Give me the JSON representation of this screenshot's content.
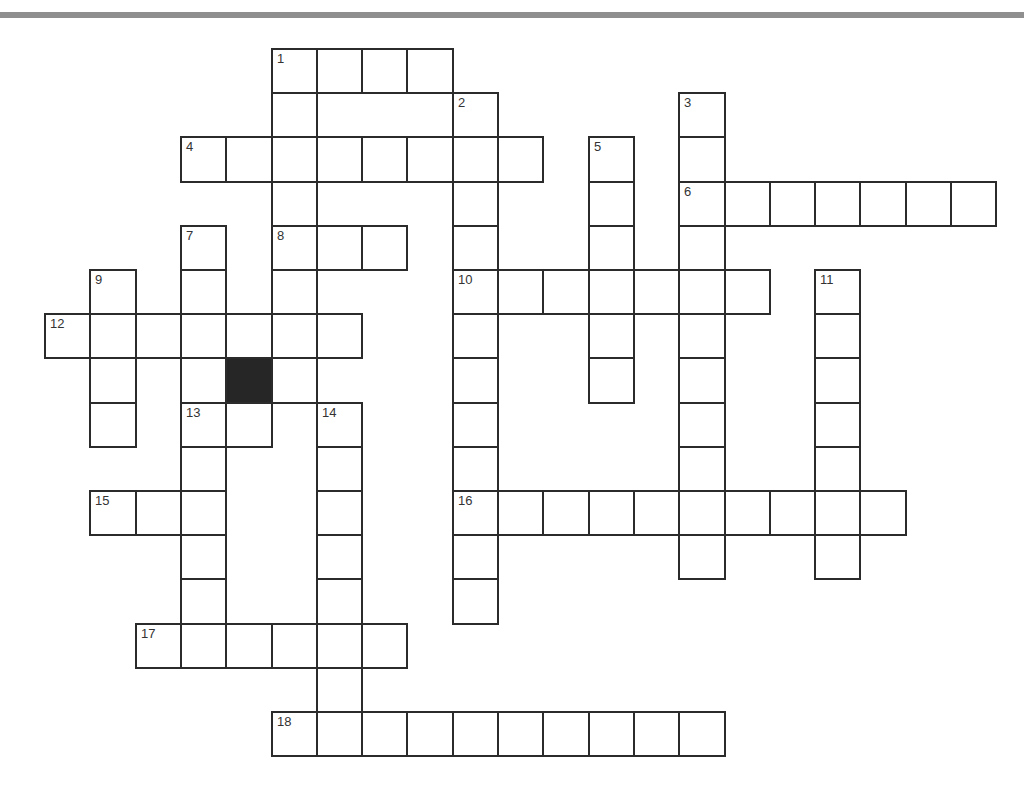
{
  "puzzle": {
    "type": "crossword",
    "grid": {
      "origin_x": 44,
      "origin_y": 48,
      "cell_w": 45.3,
      "cell_h": 44.2,
      "border_color": "#2b2b2b",
      "black_color": "#262626"
    },
    "entries": [
      {
        "number": "1",
        "direction": "across",
        "row": 0,
        "col": 5,
        "length": 4
      },
      {
        "number": "1",
        "direction": "down",
        "row": 0,
        "col": 5,
        "length": 8
      },
      {
        "number": "2",
        "direction": "down",
        "row": 1,
        "col": 9,
        "length": 12
      },
      {
        "number": "3",
        "direction": "down",
        "row": 1,
        "col": 14,
        "length": 11
      },
      {
        "number": "4",
        "direction": "across",
        "row": 2,
        "col": 3,
        "length": 8
      },
      {
        "number": "5",
        "direction": "down",
        "row": 2,
        "col": 12,
        "length": 6
      },
      {
        "number": "6",
        "direction": "across",
        "row": 3,
        "col": 14,
        "length": 7
      },
      {
        "number": "7",
        "direction": "down",
        "row": 4,
        "col": 3,
        "length": 10
      },
      {
        "number": "8",
        "direction": "across",
        "row": 4,
        "col": 5,
        "length": 3
      },
      {
        "number": "9",
        "direction": "down",
        "row": 5,
        "col": 1,
        "length": 4
      },
      {
        "number": "10",
        "direction": "across",
        "row": 5,
        "col": 9,
        "length": 7
      },
      {
        "number": "11",
        "direction": "down",
        "row": 5,
        "col": 17,
        "length": 7
      },
      {
        "number": "12",
        "direction": "across",
        "row": 6,
        "col": 0,
        "length": 7
      },
      {
        "number": "13",
        "direction": "across",
        "row": 8,
        "col": 3,
        "length": 2
      },
      {
        "number": "14",
        "direction": "down",
        "row": 8,
        "col": 6,
        "length": 8
      },
      {
        "number": "15",
        "direction": "across",
        "row": 10,
        "col": 1,
        "length": 3
      },
      {
        "number": "16",
        "direction": "across",
        "row": 10,
        "col": 9,
        "length": 10
      },
      {
        "number": "17",
        "direction": "across",
        "row": 13,
        "col": 2,
        "length": 6
      },
      {
        "number": "18",
        "direction": "across",
        "row": 15,
        "col": 5,
        "length": 10
      }
    ],
    "black_cells": [
      {
        "row": 7,
        "col": 4
      }
    ]
  }
}
